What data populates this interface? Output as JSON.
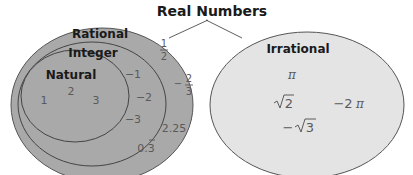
{
  "title": "Real Numbers",
  "sets": {
    "rational": {
      "label": "Rational",
      "fill": "#a9a9a9"
    },
    "integer": {
      "label": "Integer"
    },
    "natural": {
      "label": "Natural"
    },
    "irrational": {
      "label": "Irrational",
      "fill": "#e4e4e4"
    }
  },
  "natural_numbers": [
    "1",
    "2",
    "3"
  ],
  "integer_numbers": [
    "−1",
    "−2",
    "−3"
  ],
  "rational_numbers": {
    "half_num": "1",
    "half_den": "2",
    "neg_two_thirds_sign": "−",
    "neg_two_thirds_num": "2",
    "neg_two_thirds_den": "3",
    "decimal": "2.25",
    "repeating": "0.3"
  },
  "irrational_numbers": {
    "pi": "π",
    "sqrt2": "2",
    "neg_two_pi_coef": "−2",
    "neg_two_pi_sym": "π",
    "neg_sqrt3_sign": "−",
    "neg_sqrt3": "3"
  }
}
